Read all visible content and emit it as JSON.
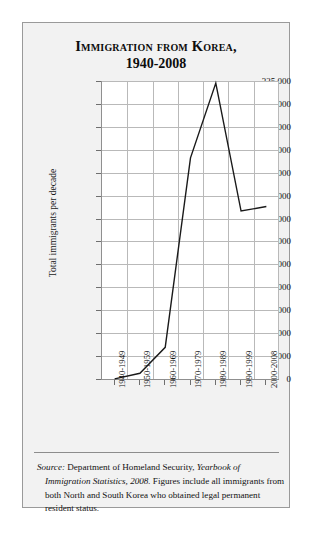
{
  "chart_data": {
    "type": "line",
    "title": "Immigration from Korea,",
    "title_line2": "1940-2008",
    "xlabel": "",
    "ylabel": "Total immigrants per decade",
    "categories": [
      "1940-1949",
      "1950-1959",
      "1960-1969",
      "1970-1979",
      "1980-1989",
      "1990-1999",
      "2000-2008"
    ],
    "values": [
      107,
      6231,
      34526,
      241192,
      322708,
      183167,
      188130
    ],
    "ylim": [
      0,
      325000
    ],
    "ytick_labels": [
      "325,000",
      "300,000",
      "275,000",
      "250,000",
      "225,000",
      "200,000",
      "175,000",
      "150,000",
      "125,000",
      "100,000",
      "75,000",
      "50,000",
      "25,000",
      "0"
    ],
    "ytick_values": [
      325000,
      300000,
      275000,
      250000,
      225000,
      200000,
      175000,
      150000,
      125000,
      100000,
      75000,
      50000,
      25000,
      0
    ],
    "grid": true,
    "legend": false,
    "line_color": "#1a1a1a"
  },
  "caption": {
    "source_word": "Source:",
    "source_body": " Department of Homeland Security, ",
    "source_title": "Yearbook of Immigration Statistics, 2008.",
    "source_tail": " Figures include all immigrants from both North and South Korea who obtained legal permanent resident status."
  }
}
